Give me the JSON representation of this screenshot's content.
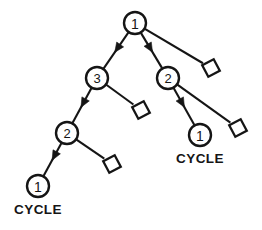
{
  "diagram": {
    "kind": "directed-tree",
    "background_color": "#ffffff",
    "stroke_color": "#151515",
    "nodes": [
      {
        "id": "n-root",
        "label": "1",
        "shape": "circle",
        "cx": 135,
        "cy": 23,
        "r": 11
      },
      {
        "id": "n-left-3",
        "label": "3",
        "shape": "circle",
        "cx": 97,
        "cy": 78,
        "r": 11
      },
      {
        "id": "n-right-2",
        "label": "2",
        "shape": "circle",
        "cx": 168,
        "cy": 78,
        "r": 11
      },
      {
        "id": "n-left-2",
        "label": "2",
        "shape": "circle",
        "cx": 67,
        "cy": 133,
        "r": 11
      },
      {
        "id": "n-right-1",
        "label": "1",
        "shape": "circle",
        "cx": 200,
        "cy": 135,
        "r": 11
      },
      {
        "id": "n-left-1",
        "label": "1",
        "shape": "circle",
        "cx": 38,
        "cy": 186,
        "r": 11
      }
    ],
    "leaves": [
      {
        "id": "leaf-root-right",
        "shape": "square",
        "cx": 211,
        "cy": 68,
        "size": 13,
        "rotation": -28
      },
      {
        "id": "leaf-3-right",
        "shape": "square",
        "cx": 141,
        "cy": 110,
        "size": 13,
        "rotation": -28
      },
      {
        "id": "leaf-2right-right",
        "shape": "square",
        "cx": 238,
        "cy": 128,
        "size": 13,
        "rotation": -28
      },
      {
        "id": "leaf-2left-right",
        "shape": "square",
        "cx": 112,
        "cy": 164,
        "size": 13,
        "rotation": -28
      }
    ],
    "edges": [
      {
        "id": "e-root-3",
        "from": "n-root",
        "to": "n-left-3",
        "arrow": true,
        "arrow_t": 0.55
      },
      {
        "id": "e-root-2",
        "from": "n-root",
        "to": "n-right-2",
        "arrow": true,
        "arrow_t": 0.55
      },
      {
        "id": "e-root-leaf",
        "from": "n-root",
        "to": "leaf-root-right",
        "arrow": false
      },
      {
        "id": "e-3-2",
        "from": "n-left-3",
        "to": "n-left-2",
        "arrow": true,
        "arrow_t": 0.55
      },
      {
        "id": "e-3-leaf",
        "from": "n-left-3",
        "to": "leaf-3-right",
        "arrow": false
      },
      {
        "id": "e-2-1",
        "from": "n-left-2",
        "to": "n-left-1",
        "arrow": true,
        "arrow_t": 0.52
      },
      {
        "id": "e-2-leaf",
        "from": "n-left-2",
        "to": "leaf-2left-right",
        "arrow": false
      },
      {
        "id": "e-r2-1",
        "from": "n-right-2",
        "to": "n-right-1",
        "arrow": true,
        "arrow_t": 0.52
      },
      {
        "id": "e-r2-leaf",
        "from": "n-right-2",
        "to": "leaf-2right-right",
        "arrow": false
      }
    ],
    "annotations": [
      {
        "id": "cycle-left",
        "text": "CYCLE",
        "x": 38,
        "y": 209
      },
      {
        "id": "cycle-right",
        "text": "CYCLE",
        "x": 200,
        "y": 158
      }
    ]
  }
}
